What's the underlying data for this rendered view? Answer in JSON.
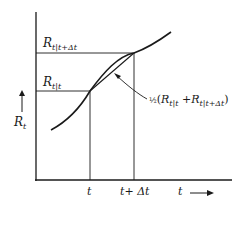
{
  "diagram": {
    "y_axis_label": "R",
    "y_axis_label_sub": "t",
    "x_axis_label": "t",
    "x_ticks": [
      "t",
      "t+ Δt"
    ],
    "labels": {
      "r_t_given_t": {
        "main": "R",
        "sub": "t|t"
      },
      "r_t_given_t_dt": {
        "main": "R",
        "sub": "t|t+Δt"
      },
      "average": {
        "frac": "½",
        "open": "(",
        "r1": "R",
        "s1": "t|t",
        "plus": " +",
        "r2": "R",
        "s2": "t|t+Δt",
        "close": ")"
      }
    },
    "colors": {
      "line": "#1a1a1a",
      "background": "#ffffff"
    }
  }
}
